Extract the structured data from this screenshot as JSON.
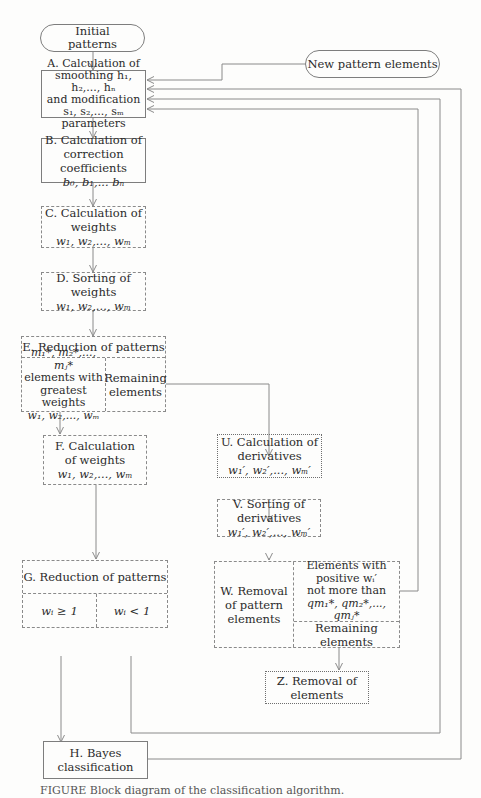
{
  "diagram": {
    "type": "flowchart",
    "nodes": {
      "start": {
        "id": "start",
        "shape": "terminal",
        "lines": [
          "Initial",
          "patterns"
        ]
      },
      "new": {
        "id": "new",
        "shape": "terminal",
        "lines": [
          "New pattern elements"
        ]
      },
      "A": {
        "id": "A",
        "shape": "process-solid",
        "lines": [
          "A. Calculation of",
          "smoothing h₁, h₂,..., hₙ",
          "and modification",
          "s₁, s₂,..., sₘ parameters"
        ]
      },
      "B": {
        "id": "B",
        "shape": "process-solid",
        "lines": [
          "B. Calculation of",
          "correction coefficients",
          "b₀, b₁,... bₙ"
        ]
      },
      "C": {
        "id": "C",
        "shape": "process-dashed",
        "lines": [
          "C. Calculation of",
          "weights",
          "w₁, w₂,..., wₘ"
        ]
      },
      "D": {
        "id": "D",
        "shape": "process-dashed",
        "lines": [
          "D. Sorting of weights",
          "w₁, w₂,..., wₘ"
        ]
      },
      "E": {
        "id": "E",
        "shape": "split-dashed",
        "title": "E. Reduction of patterns",
        "left_lines": [
          "m₁*, m₂*,..., mⱼ*",
          "elements with",
          "greatest weights",
          "w₁, w₂,..., wₘ"
        ],
        "right_lines": [
          "Remaining",
          "elements"
        ]
      },
      "F": {
        "id": "F",
        "shape": "process-dashed",
        "lines": [
          "F. Calculation",
          "of weights",
          "w₁, w₂,..., wₘ"
        ]
      },
      "G": {
        "id": "G",
        "shape": "split-dashed",
        "title": "G. Reduction of patterns",
        "left_lines": [
          "wᵢ ≥ 1"
        ],
        "right_lines": [
          "wᵢ < 1"
        ]
      },
      "H": {
        "id": "H",
        "shape": "process-solid",
        "lines": [
          "H. Bayes classification"
        ]
      },
      "U": {
        "id": "U",
        "shape": "process-dotted",
        "lines": [
          "U. Calculation of",
          "derivatives",
          "w₁′, w₂′,..., wₘ′"
        ]
      },
      "V": {
        "id": "V",
        "shape": "process-dashed",
        "lines": [
          "V. Sorting of derivatives",
          "w₁′, w₂′,..., wₘ′"
        ]
      },
      "W": {
        "id": "W",
        "shape": "split-dashed",
        "label_lines": [
          "W. Removal",
          "of pattern",
          "elements"
        ],
        "top_lines": [
          "Elements with",
          "positive wᵢ′",
          "not more than",
          "qm₁*, qm₂*,..., qmⱼ*"
        ],
        "bottom_lines": [
          "Remaining elements"
        ]
      },
      "Z": {
        "id": "Z",
        "shape": "process-dotted",
        "lines": [
          "Z. Removal of elements"
        ]
      }
    },
    "edges": [
      {
        "from": "start",
        "to": "A"
      },
      {
        "from": "new",
        "to": "A"
      },
      {
        "from": "A",
        "to": "B"
      },
      {
        "from": "B",
        "to": "C"
      },
      {
        "from": "C",
        "to": "D"
      },
      {
        "from": "D",
        "to": "E"
      },
      {
        "from": "E.left",
        "to": "F"
      },
      {
        "from": "E.right",
        "to": "U"
      },
      {
        "from": "F",
        "to": "G"
      },
      {
        "from": "U",
        "to": "V"
      },
      {
        "from": "V",
        "to": "W"
      },
      {
        "from": "W.top",
        "to": "A"
      },
      {
        "from": "W.bottom",
        "to": "Z"
      },
      {
        "from": "G.left",
        "to": "H"
      },
      {
        "from": "G.right",
        "to": "A"
      },
      {
        "from": "H",
        "to": "A"
      }
    ],
    "caption": "FIGURE  Block diagram of the classification algorithm."
  }
}
